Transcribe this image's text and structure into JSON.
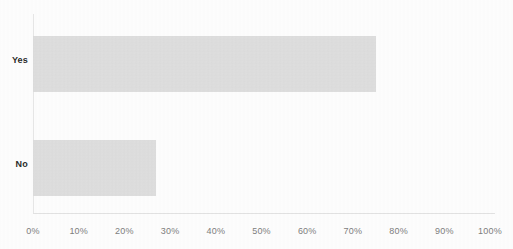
{
  "chart_data": {
    "type": "bar",
    "orientation": "horizontal",
    "title": "",
    "xlabel": "",
    "ylabel": "",
    "categories": [
      "Yes",
      "No"
    ],
    "values": [
      75,
      27
    ],
    "value_suffix": "%",
    "xlim": [
      0,
      100
    ],
    "xticks": [
      0,
      10,
      20,
      30,
      40,
      50,
      60,
      70,
      80,
      90,
      100
    ],
    "xtick_labels": [
      "0%",
      "10%",
      "20%",
      "30%",
      "40%",
      "50%",
      "60%",
      "70%",
      "80%",
      "90%",
      "100%"
    ],
    "grid": false,
    "legend": false,
    "series": [
      {
        "name": "",
        "values": [
          75,
          27
        ]
      }
    ],
    "colors": {
      "bar_fill": "#d2d2d2",
      "category_label": "#2b2b2b",
      "tick_label": "#7d7d7d",
      "axis_line": "#e2e2e2",
      "background": "#fdfdfd"
    }
  }
}
